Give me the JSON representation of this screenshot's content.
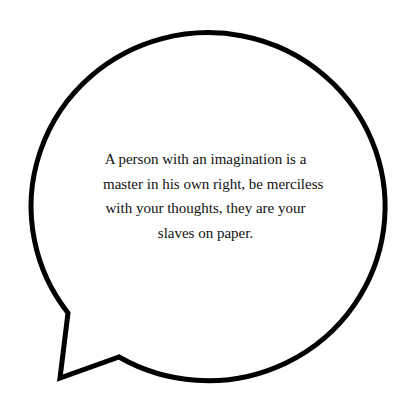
{
  "speech_bubble": {
    "stroke_color": "#000000",
    "fill_color": "#ffffff",
    "quote_lines": [
      "A person with an imagination is a",
      "master in his own right, be merciless",
      "with your thoughts, they are your",
      "slaves on paper."
    ]
  }
}
